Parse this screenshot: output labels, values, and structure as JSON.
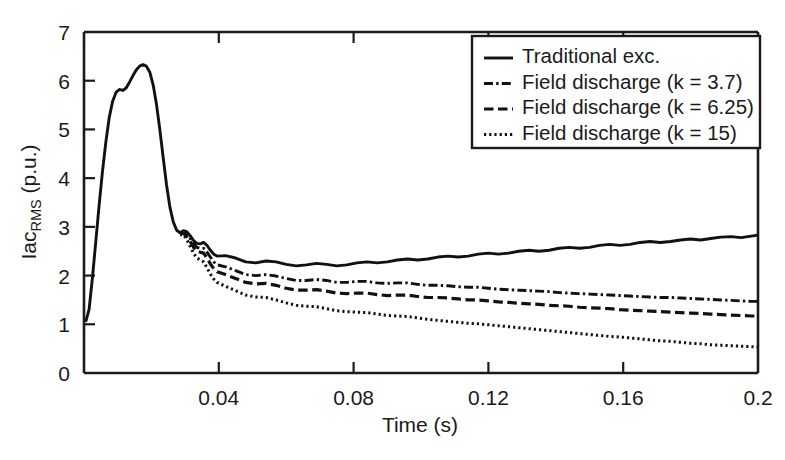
{
  "chart_data": {
    "type": "line",
    "title": "",
    "xlabel": "Time (s)",
    "ylabel": "Iac_RMS (p.u.)",
    "ylabel_main": "Iac",
    "ylabel_sub": "RMS",
    "ylabel_unit": " (p.u.)",
    "xlim": [
      0,
      0.2
    ],
    "ylim": [
      0,
      7
    ],
    "xticks": [
      0.04,
      0.08,
      0.12,
      0.16,
      0.2
    ],
    "xticklabels": [
      "0.04",
      "0.08",
      "0.12",
      "0.16",
      "0.2"
    ],
    "yticks": [
      0,
      1,
      2,
      3,
      4,
      5,
      6,
      7
    ],
    "yticklabels": [
      "0",
      "1",
      "2",
      "3",
      "4",
      "5",
      "6",
      "7"
    ],
    "grid": false,
    "legend_position": "upper-right",
    "line_color": "#111111",
    "background": "#ffffff",
    "series": [
      {
        "name": "Traditional exc.",
        "style": "solid",
        "x": [
          0.0005,
          0.0015,
          0.0025,
          0.0035,
          0.0045,
          0.0055,
          0.0065,
          0.0075,
          0.0085,
          0.0095,
          0.0105,
          0.0115,
          0.0125,
          0.0135,
          0.0145,
          0.0155,
          0.0165,
          0.0175,
          0.0185,
          0.0195,
          0.0205,
          0.0215,
          0.0225,
          0.0235,
          0.0245,
          0.0255,
          0.0265,
          0.0275,
          0.0285,
          0.0295,
          0.0305,
          0.0315,
          0.0325,
          0.0335,
          0.0345,
          0.0355,
          0.0365,
          0.0375,
          0.0385,
          0.0395,
          0.042,
          0.045,
          0.048,
          0.051,
          0.054,
          0.057,
          0.06,
          0.063,
          0.066,
          0.069,
          0.072,
          0.075,
          0.078,
          0.081,
          0.084,
          0.087,
          0.09,
          0.093,
          0.096,
          0.099,
          0.102,
          0.105,
          0.108,
          0.111,
          0.114,
          0.117,
          0.12,
          0.123,
          0.126,
          0.129,
          0.132,
          0.135,
          0.138,
          0.141,
          0.144,
          0.147,
          0.15,
          0.153,
          0.156,
          0.159,
          0.162,
          0.165,
          0.168,
          0.171,
          0.174,
          0.177,
          0.18,
          0.183,
          0.186,
          0.189,
          0.192,
          0.195,
          0.198,
          0.2
        ],
        "y": [
          1.05,
          1.3,
          1.95,
          2.7,
          3.45,
          4.15,
          4.75,
          5.25,
          5.58,
          5.76,
          5.82,
          5.8,
          5.85,
          5.97,
          6.1,
          6.22,
          6.3,
          6.33,
          6.3,
          6.18,
          5.92,
          5.52,
          5.0,
          4.42,
          3.86,
          3.4,
          3.1,
          2.93,
          2.88,
          2.92,
          2.9,
          2.82,
          2.72,
          2.66,
          2.65,
          2.68,
          2.62,
          2.52,
          2.44,
          2.4,
          2.41,
          2.36,
          2.28,
          2.26,
          2.3,
          2.28,
          2.23,
          2.2,
          2.22,
          2.25,
          2.23,
          2.2,
          2.22,
          2.26,
          2.28,
          2.26,
          2.28,
          2.32,
          2.34,
          2.32,
          2.34,
          2.38,
          2.4,
          2.38,
          2.4,
          2.44,
          2.46,
          2.44,
          2.46,
          2.5,
          2.52,
          2.5,
          2.52,
          2.56,
          2.58,
          2.56,
          2.58,
          2.62,
          2.64,
          2.62,
          2.64,
          2.68,
          2.7,
          2.68,
          2.7,
          2.73,
          2.75,
          2.73,
          2.76,
          2.79,
          2.8,
          2.78,
          2.81,
          2.83
        ]
      },
      {
        "name": "Field discharge (k = 3.7)",
        "style": "dashdot",
        "x": [
          0.0285,
          0.0295,
          0.0305,
          0.0315,
          0.0325,
          0.0335,
          0.0345,
          0.0355,
          0.0365,
          0.0375,
          0.0385,
          0.0395,
          0.042,
          0.045,
          0.048,
          0.051,
          0.054,
          0.057,
          0.06,
          0.063,
          0.066,
          0.069,
          0.072,
          0.075,
          0.078,
          0.081,
          0.084,
          0.087,
          0.09,
          0.093,
          0.096,
          0.099,
          0.102,
          0.105,
          0.108,
          0.111,
          0.114,
          0.117,
          0.12,
          0.123,
          0.126,
          0.129,
          0.132,
          0.135,
          0.138,
          0.141,
          0.144,
          0.147,
          0.15,
          0.153,
          0.156,
          0.159,
          0.162,
          0.165,
          0.168,
          0.171,
          0.174,
          0.177,
          0.18,
          0.183,
          0.186,
          0.189,
          0.192,
          0.195,
          0.198,
          0.2
        ],
        "y": [
          2.88,
          2.9,
          2.85,
          2.76,
          2.66,
          2.58,
          2.56,
          2.56,
          2.48,
          2.38,
          2.28,
          2.22,
          2.18,
          2.1,
          2.02,
          2.0,
          2.02,
          1.99,
          1.94,
          1.9,
          1.9,
          1.92,
          1.9,
          1.86,
          1.86,
          1.88,
          1.88,
          1.85,
          1.84,
          1.85,
          1.85,
          1.82,
          1.8,
          1.8,
          1.79,
          1.77,
          1.76,
          1.76,
          1.74,
          1.72,
          1.71,
          1.7,
          1.69,
          1.68,
          1.67,
          1.65,
          1.64,
          1.63,
          1.62,
          1.61,
          1.6,
          1.59,
          1.58,
          1.57,
          1.56,
          1.55,
          1.55,
          1.54,
          1.53,
          1.52,
          1.51,
          1.5,
          1.49,
          1.48,
          1.47,
          1.47
        ]
      },
      {
        "name": "Field discharge (k = 6.25)",
        "style": "dashed",
        "x": [
          0.0285,
          0.0295,
          0.0305,
          0.0315,
          0.0325,
          0.0335,
          0.0345,
          0.0355,
          0.0365,
          0.0375,
          0.0385,
          0.0395,
          0.042,
          0.045,
          0.048,
          0.051,
          0.054,
          0.057,
          0.06,
          0.063,
          0.066,
          0.069,
          0.072,
          0.075,
          0.078,
          0.081,
          0.084,
          0.087,
          0.09,
          0.093,
          0.096,
          0.099,
          0.102,
          0.105,
          0.108,
          0.111,
          0.114,
          0.117,
          0.12,
          0.123,
          0.126,
          0.129,
          0.132,
          0.135,
          0.138,
          0.141,
          0.144,
          0.147,
          0.15,
          0.153,
          0.156,
          0.159,
          0.162,
          0.165,
          0.168,
          0.171,
          0.174,
          0.177,
          0.18,
          0.183,
          0.186,
          0.189,
          0.192,
          0.195,
          0.198,
          0.2
        ],
        "y": [
          2.86,
          2.87,
          2.8,
          2.7,
          2.58,
          2.5,
          2.48,
          2.46,
          2.36,
          2.24,
          2.14,
          2.08,
          2.02,
          1.94,
          1.86,
          1.83,
          1.84,
          1.8,
          1.74,
          1.7,
          1.7,
          1.71,
          1.68,
          1.64,
          1.63,
          1.64,
          1.64,
          1.61,
          1.59,
          1.6,
          1.6,
          1.57,
          1.55,
          1.55,
          1.54,
          1.52,
          1.5,
          1.5,
          1.48,
          1.46,
          1.45,
          1.43,
          1.42,
          1.41,
          1.39,
          1.38,
          1.37,
          1.35,
          1.34,
          1.33,
          1.32,
          1.3,
          1.29,
          1.28,
          1.27,
          1.26,
          1.25,
          1.24,
          1.23,
          1.22,
          1.21,
          1.2,
          1.19,
          1.18,
          1.17,
          1.17
        ]
      },
      {
        "name": "Field discharge (k = 15)",
        "style": "dotted",
        "x": [
          0.0285,
          0.0295,
          0.0305,
          0.0315,
          0.0325,
          0.0335,
          0.0345,
          0.0355,
          0.0365,
          0.0375,
          0.0385,
          0.0395,
          0.042,
          0.045,
          0.048,
          0.051,
          0.054,
          0.057,
          0.06,
          0.063,
          0.066,
          0.069,
          0.072,
          0.075,
          0.078,
          0.081,
          0.084,
          0.087,
          0.09,
          0.093,
          0.096,
          0.099,
          0.102,
          0.105,
          0.108,
          0.111,
          0.114,
          0.117,
          0.12,
          0.123,
          0.126,
          0.129,
          0.132,
          0.135,
          0.138,
          0.141,
          0.144,
          0.147,
          0.15,
          0.153,
          0.156,
          0.159,
          0.162,
          0.165,
          0.168,
          0.171,
          0.174,
          0.177,
          0.18,
          0.183,
          0.186,
          0.189,
          0.192,
          0.195,
          0.198,
          0.2
        ],
        "y": [
          2.84,
          2.84,
          2.74,
          2.6,
          2.46,
          2.36,
          2.32,
          2.28,
          2.16,
          2.03,
          1.93,
          1.86,
          1.78,
          1.69,
          1.6,
          1.56,
          1.55,
          1.5,
          1.44,
          1.39,
          1.37,
          1.36,
          1.32,
          1.28,
          1.26,
          1.25,
          1.24,
          1.21,
          1.18,
          1.17,
          1.16,
          1.13,
          1.1,
          1.08,
          1.06,
          1.04,
          1.02,
          1.01,
          0.99,
          0.97,
          0.95,
          0.93,
          0.91,
          0.89,
          0.87,
          0.85,
          0.83,
          0.81,
          0.79,
          0.77,
          0.75,
          0.74,
          0.72,
          0.7,
          0.68,
          0.66,
          0.65,
          0.63,
          0.61,
          0.6,
          0.58,
          0.57,
          0.56,
          0.55,
          0.54,
          0.53
        ]
      }
    ],
    "legend": [
      {
        "label": "Traditional exc.",
        "style": "solid"
      },
      {
        "label": "Field discharge (k = 3.7)",
        "style": "dashdot"
      },
      {
        "label": "Field discharge (k = 6.25)",
        "style": "dashed"
      },
      {
        "label": "Field discharge (k = 15)",
        "style": "dotted"
      }
    ]
  }
}
